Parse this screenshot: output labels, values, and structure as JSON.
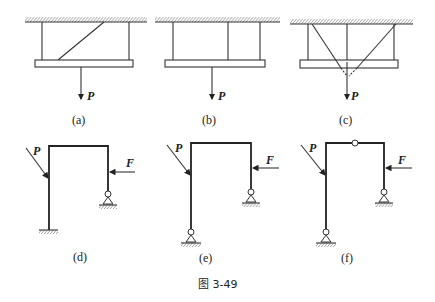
{
  "figure": {
    "caption": "图 3-49",
    "panels": [
      {
        "id": "a",
        "label": "(a)",
        "force_labels": [
          "P"
        ],
        "description": "Rigid beam hung from ceiling by two vertical rods and one inclined rod, vertical load P"
      },
      {
        "id": "b",
        "label": "(b)",
        "force_labels": [
          "P"
        ],
        "description": "Rigid beam hung from ceiling by three vertical rods, vertical load P"
      },
      {
        "id": "c",
        "label": "(c)",
        "force_labels": [
          "P"
        ],
        "description": "Rigid beam hung by three vertical rods and two inclined rods meeting below beam, vertical load P"
      },
      {
        "id": "d",
        "label": "(d)",
        "force_labels": [
          "P",
          "F"
        ],
        "description": "Portal frame, fixed left support, pinned right support, inclined load P and horizontal load F"
      },
      {
        "id": "e",
        "label": "(e)",
        "force_labels": [
          "P",
          "F"
        ],
        "description": "Portal frame with pinned supports on both legs, inclined load P and horizontal load F"
      },
      {
        "id": "f",
        "label": "(f)",
        "force_labels": [
          "P",
          "F"
        ],
        "description": "Three-hinged portal frame with middle hinge in top beam, inclined load P and horizontal load F"
      }
    ]
  }
}
